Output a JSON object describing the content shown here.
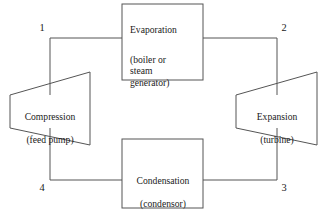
{
  "diagram": {
    "background_color": "#ffffff",
    "line_color": "#555555",
    "text_color": "#1a1a1a",
    "nodes": {
      "evaporation": {
        "title": "Evaporation",
        "subtitle": "(boiler or\nsteam\ngenerator)",
        "shape": "rectangle"
      },
      "condensation": {
        "title": "Condensation",
        "subtitle": "(condensor)",
        "shape": "rectangle"
      },
      "compression": {
        "title": "Compression",
        "subtitle": "(feed pump)",
        "shape": "trapezoid-pump"
      },
      "expansion": {
        "title": "Expansion",
        "subtitle": "(turbine)",
        "shape": "trapezoid-turbine"
      }
    },
    "state_points": {
      "one": "1",
      "two": "2",
      "three": "3",
      "four": "4"
    }
  }
}
